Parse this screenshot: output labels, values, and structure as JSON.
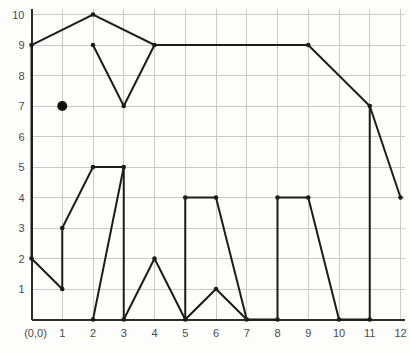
{
  "figure": {
    "background_color": "#fdfdfc",
    "line_color": "#1c1c1c",
    "grid_color": "#c9c9c9",
    "axis_color": "#2b2b2b"
  },
  "axes": {
    "origin_label": "(0,0)",
    "x_labels": [
      "1",
      "2",
      "3",
      "4",
      "5",
      "6",
      "7",
      "8",
      "9",
      "10",
      "11",
      "12"
    ],
    "y_labels": [
      "1",
      "2",
      "3",
      "4",
      "5",
      "6",
      "7",
      "8",
      "9",
      "10"
    ]
  },
  "chart_data": {
    "type": "line",
    "xlabel": "",
    "ylabel": "",
    "xlim": [
      0,
      12
    ],
    "ylim": [
      0,
      10
    ],
    "x_ticks": [
      0,
      1,
      2,
      3,
      4,
      5,
      6,
      7,
      8,
      9,
      10,
      11,
      12
    ],
    "y_ticks": [
      0,
      1,
      2,
      3,
      4,
      5,
      6,
      7,
      8,
      9,
      10
    ],
    "grid": true,
    "legend": "none",
    "series": [
      {
        "name": "elephant-outline",
        "closed": false,
        "points": [
          [
            0,
            2
          ],
          [
            0,
            9
          ],
          [
            2,
            10
          ],
          [
            4,
            9
          ],
          [
            9,
            9
          ],
          [
            11,
            7
          ],
          [
            12,
            4
          ]
        ]
      },
      {
        "name": "ear",
        "closed": false,
        "points": [
          [
            2,
            9
          ],
          [
            3,
            7
          ],
          [
            4,
            9
          ]
        ]
      },
      {
        "name": "trunk-and-front-leg",
        "closed": false,
        "points": [
          [
            0,
            2
          ],
          [
            1,
            1
          ],
          [
            1,
            3
          ],
          [
            2,
            5
          ],
          [
            3,
            5
          ],
          [
            2,
            0
          ]
        ]
      },
      {
        "name": "front-leg-right",
        "closed": false,
        "points": [
          [
            3,
            5
          ],
          [
            3,
            0
          ]
        ]
      },
      {
        "name": "belly-and-legs",
        "closed": false,
        "points": [
          [
            3,
            0
          ],
          [
            4,
            2
          ],
          [
            5,
            0
          ],
          [
            6,
            1
          ],
          [
            7,
            0
          ],
          [
            8,
            0
          ],
          [
            8,
            4
          ],
          [
            9,
            4
          ],
          [
            10,
            0
          ],
          [
            11,
            0
          ],
          [
            11,
            7
          ]
        ]
      },
      {
        "name": "middle-legs",
        "closed": false,
        "points": [
          [
            5,
            0
          ],
          [
            5,
            4
          ],
          [
            6,
            4
          ],
          [
            7,
            0
          ]
        ]
      }
    ],
    "markers": [
      [
        0,
        2
      ],
      [
        0,
        9
      ],
      [
        2,
        10
      ],
      [
        4,
        9
      ],
      [
        9,
        9
      ],
      [
        11,
        7
      ],
      [
        12,
        4
      ],
      [
        2,
        9
      ],
      [
        3,
        7
      ],
      [
        1,
        1
      ],
      [
        1,
        3
      ],
      [
        2,
        5
      ],
      [
        3,
        5
      ],
      [
        2,
        0
      ],
      [
        3,
        0
      ],
      [
        4,
        2
      ],
      [
        5,
        0
      ],
      [
        6,
        1
      ],
      [
        7,
        0
      ],
      [
        8,
        0
      ],
      [
        8,
        4
      ],
      [
        9,
        4
      ],
      [
        10,
        0
      ],
      [
        11,
        0
      ],
      [
        5,
        4
      ],
      [
        6,
        4
      ]
    ],
    "annotations": [
      {
        "name": "eye",
        "type": "point",
        "x": 1,
        "y": 7,
        "radius_px": 5
      }
    ]
  }
}
